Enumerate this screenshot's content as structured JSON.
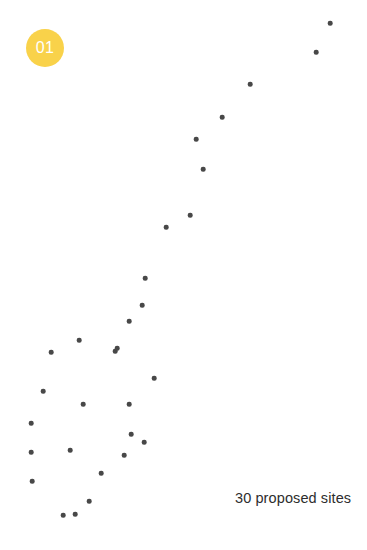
{
  "badge": {
    "label": "01",
    "background_color": "#F9D24A",
    "text_color": "#FFFFFF"
  },
  "caption": {
    "text": "30 proposed sites",
    "count": 30,
    "noun": "proposed sites",
    "color": "#2D2D2D"
  },
  "chart_data": {
    "type": "scatter",
    "title": "",
    "subtitle": "",
    "xlabel": "",
    "ylabel": "",
    "xlim": [
      0,
      367
    ],
    "ylim": [
      0,
      550
    ],
    "grid": false,
    "legend": false,
    "annotations": [
      "01",
      "30 proposed sites"
    ],
    "marker": {
      "shape": "circle",
      "color": "#484848",
      "diameter_px": 4.6
    },
    "point_count": 30,
    "points": [
      {
        "x": 330,
        "y": 23
      },
      {
        "x": 316,
        "y": 52
      },
      {
        "x": 250,
        "y": 84
      },
      {
        "x": 222,
        "y": 117
      },
      {
        "x": 196,
        "y": 139
      },
      {
        "x": 203,
        "y": 169
      },
      {
        "x": 190,
        "y": 215
      },
      {
        "x": 166,
        "y": 227
      },
      {
        "x": 145,
        "y": 278
      },
      {
        "x": 142,
        "y": 305
      },
      {
        "x": 129,
        "y": 321
      },
      {
        "x": 79,
        "y": 340
      },
      {
        "x": 115,
        "y": 351
      },
      {
        "x": 51,
        "y": 352
      },
      {
        "x": 117,
        "y": 348
      },
      {
        "x": 154,
        "y": 378
      },
      {
        "x": 43,
        "y": 391
      },
      {
        "x": 83,
        "y": 404
      },
      {
        "x": 129,
        "y": 404
      },
      {
        "x": 31,
        "y": 423
      },
      {
        "x": 131,
        "y": 434
      },
      {
        "x": 144,
        "y": 442
      },
      {
        "x": 70,
        "y": 450
      },
      {
        "x": 31,
        "y": 452
      },
      {
        "x": 124,
        "y": 455
      },
      {
        "x": 101,
        "y": 473
      },
      {
        "x": 32,
        "y": 481
      },
      {
        "x": 89,
        "y": 501
      },
      {
        "x": 63,
        "y": 515
      },
      {
        "x": 75,
        "y": 514
      }
    ]
  }
}
